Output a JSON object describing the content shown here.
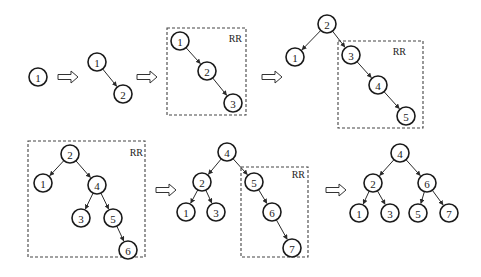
{
  "rotation_label": "RR",
  "node_radius": 9,
  "stages": [
    {
      "id": "stage-1",
      "nodes": [
        {
          "label": "1",
          "x": 38,
          "y": 77
        }
      ],
      "edges": []
    },
    {
      "id": "stage-2",
      "nodes": [
        {
          "label": "1",
          "x": 97,
          "y": 62
        },
        {
          "label": "2",
          "x": 123,
          "y": 94
        }
      ],
      "edges": [
        [
          0,
          1
        ]
      ]
    },
    {
      "id": "stage-3",
      "box": {
        "x": 167,
        "y": 28,
        "w": 79,
        "h": 87,
        "label": "RR",
        "lx": 242,
        "ly": 42
      },
      "nodes": [
        {
          "label": "1",
          "x": 180,
          "y": 41
        },
        {
          "label": "2",
          "x": 207,
          "y": 71
        },
        {
          "label": "3",
          "x": 233,
          "y": 103
        }
      ],
      "edges": [
        [
          0,
          1
        ],
        [
          1,
          2
        ]
      ]
    },
    {
      "id": "stage-4",
      "box": {
        "x": 338,
        "y": 41,
        "w": 85,
        "h": 87,
        "label": "RR",
        "lx": 406,
        "ly": 55
      },
      "nodes": [
        {
          "label": "2",
          "x": 327,
          "y": 24
        },
        {
          "label": "1",
          "x": 295,
          "y": 57
        },
        {
          "label": "3",
          "x": 351,
          "y": 55
        },
        {
          "label": "4",
          "x": 378,
          "y": 85
        },
        {
          "label": "5",
          "x": 406,
          "y": 116
        }
      ],
      "edges": [
        [
          0,
          1
        ],
        [
          0,
          2
        ],
        [
          2,
          3
        ],
        [
          3,
          4
        ]
      ]
    },
    {
      "id": "stage-5",
      "box": {
        "x": 28,
        "y": 141,
        "w": 117,
        "h": 116,
        "label": "RR",
        "lx": 143,
        "ly": 156
      },
      "nodes": [
        {
          "label": "2",
          "x": 70,
          "y": 154
        },
        {
          "label": "1",
          "x": 43,
          "y": 183
        },
        {
          "label": "4",
          "x": 97,
          "y": 185
        },
        {
          "label": "3",
          "x": 81,
          "y": 218
        },
        {
          "label": "5",
          "x": 113,
          "y": 218
        },
        {
          "label": "6",
          "x": 128,
          "y": 250
        }
      ],
      "edges": [
        [
          0,
          1
        ],
        [
          0,
          2
        ],
        [
          2,
          3
        ],
        [
          2,
          4
        ],
        [
          4,
          5
        ]
      ]
    },
    {
      "id": "stage-6",
      "box": {
        "x": 241,
        "y": 167,
        "w": 67,
        "h": 90,
        "label": "RR",
        "lx": 305,
        "ly": 178
      },
      "nodes": [
        {
          "label": "4",
          "x": 227,
          "y": 152
        },
        {
          "label": "2",
          "x": 202,
          "y": 182
        },
        {
          "label": "5",
          "x": 254,
          "y": 182
        },
        {
          "label": "1",
          "x": 186,
          "y": 212
        },
        {
          "label": "3",
          "x": 216,
          "y": 212
        },
        {
          "label": "6",
          "x": 272,
          "y": 212
        },
        {
          "label": "7",
          "x": 292,
          "y": 248
        }
      ],
      "edges": [
        [
          0,
          1
        ],
        [
          0,
          2
        ],
        [
          1,
          3
        ],
        [
          1,
          4
        ],
        [
          2,
          5
        ],
        [
          5,
          6
        ]
      ]
    },
    {
      "id": "stage-7",
      "nodes": [
        {
          "label": "4",
          "x": 400,
          "y": 153
        },
        {
          "label": "2",
          "x": 373,
          "y": 183
        },
        {
          "label": "6",
          "x": 427,
          "y": 183
        },
        {
          "label": "1",
          "x": 359,
          "y": 213
        },
        {
          "label": "3",
          "x": 390,
          "y": 213
        },
        {
          "label": "5",
          "x": 418,
          "y": 213
        },
        {
          "label": "7",
          "x": 449,
          "y": 213
        }
      ],
      "edges": [
        [
          0,
          1
        ],
        [
          0,
          2
        ],
        [
          1,
          3
        ],
        [
          1,
          4
        ],
        [
          2,
          5
        ],
        [
          2,
          6
        ]
      ]
    }
  ],
  "transition_arrows": [
    {
      "x": 58,
      "y": 77
    },
    {
      "x": 137,
      "y": 77
    },
    {
      "x": 262,
      "y": 77
    },
    {
      "x": 156,
      "y": 190
    },
    {
      "x": 326,
      "y": 190
    }
  ]
}
